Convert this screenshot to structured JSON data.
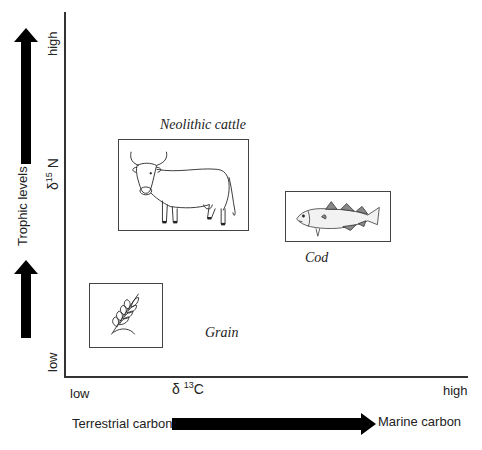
{
  "diagram": {
    "y_axis": {
      "label": "δ",
      "label_sup": "15",
      "label_after": "N",
      "low": "low",
      "high": "high",
      "side_label": "Trophic levels"
    },
    "x_axis": {
      "label": "δ ",
      "label_sup": "13",
      "label_after": "C",
      "low": "low",
      "high": "high",
      "from_label": "Terrestrial carbon",
      "to_label": "Marine carbon"
    },
    "items": [
      {
        "name": "Neolithic cattle",
        "icon": "cattle-icon",
        "position": "mid-left, high"
      },
      {
        "name": "Cod",
        "icon": "fish-icon",
        "position": "right, mid"
      },
      {
        "name": "Grain",
        "icon": "wheat-icon",
        "position": "left, low"
      }
    ],
    "colors": {
      "line": "#333333",
      "arrow": "#000000",
      "background": "#ffffff"
    }
  }
}
